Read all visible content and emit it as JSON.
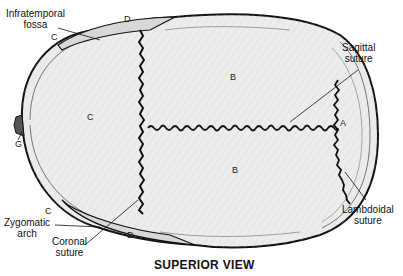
{
  "figure": {
    "title": "SUPERIOR VIEW",
    "labels": {
      "infratemporal_fossa": [
        "Infratemporal",
        "fossa"
      ],
      "sagittal_suture": [
        "Sagittal",
        "suture"
      ],
      "lambdoidal_suture": [
        "Lambdoidal",
        "suture"
      ],
      "zygomatic_arch": [
        "Zygomatic",
        "arch"
      ],
      "coronal_suture": [
        "Coronal",
        "suture"
      ]
    },
    "bone_letters": {
      "frontal": "C",
      "parietal_left": "B",
      "parietal_right": "B",
      "occipital": "A",
      "zygomatic_top": "C",
      "zygomatic_bottom": "C",
      "temporal_top": "D",
      "temporal_bottom": "D",
      "nasal": "G"
    },
    "colors": {
      "ink": "#111111",
      "bone_fill": "#ececec",
      "bone_shade": "#d8d8d8",
      "background": "#ffffff"
    }
  }
}
